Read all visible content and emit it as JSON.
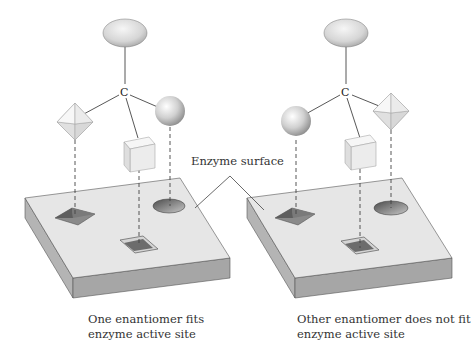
{
  "figure": {
    "callout": {
      "label": "Enzyme surface"
    },
    "left_panel": {
      "center_atom": "C",
      "substituents": [
        "ellipsoid-top",
        "octahedron-left",
        "cube-front",
        "sphere-right"
      ],
      "surface_sites": [
        "pyramid-pit",
        "square-pit",
        "round-pit"
      ],
      "caption_line1": "One enantiomer fits",
      "caption_line2": "enzyme active site"
    },
    "right_panel": {
      "center_atom": "C",
      "substituents": [
        "ellipsoid-top",
        "sphere-left",
        "cube-front",
        "octahedron-right"
      ],
      "surface_sites": [
        "pyramid-pit",
        "square-pit",
        "round-pit"
      ],
      "caption_line1": "Other enantiomer does not fit",
      "caption_line2": "enzyme active site"
    },
    "colors": {
      "slab_top": "#e6e6e6",
      "slab_side": "#a9a9a9",
      "slab_front": "#bdbdbd",
      "shape_fill": "#ededed",
      "pit_dark": "#6f6f6f",
      "line": "#444444"
    }
  }
}
